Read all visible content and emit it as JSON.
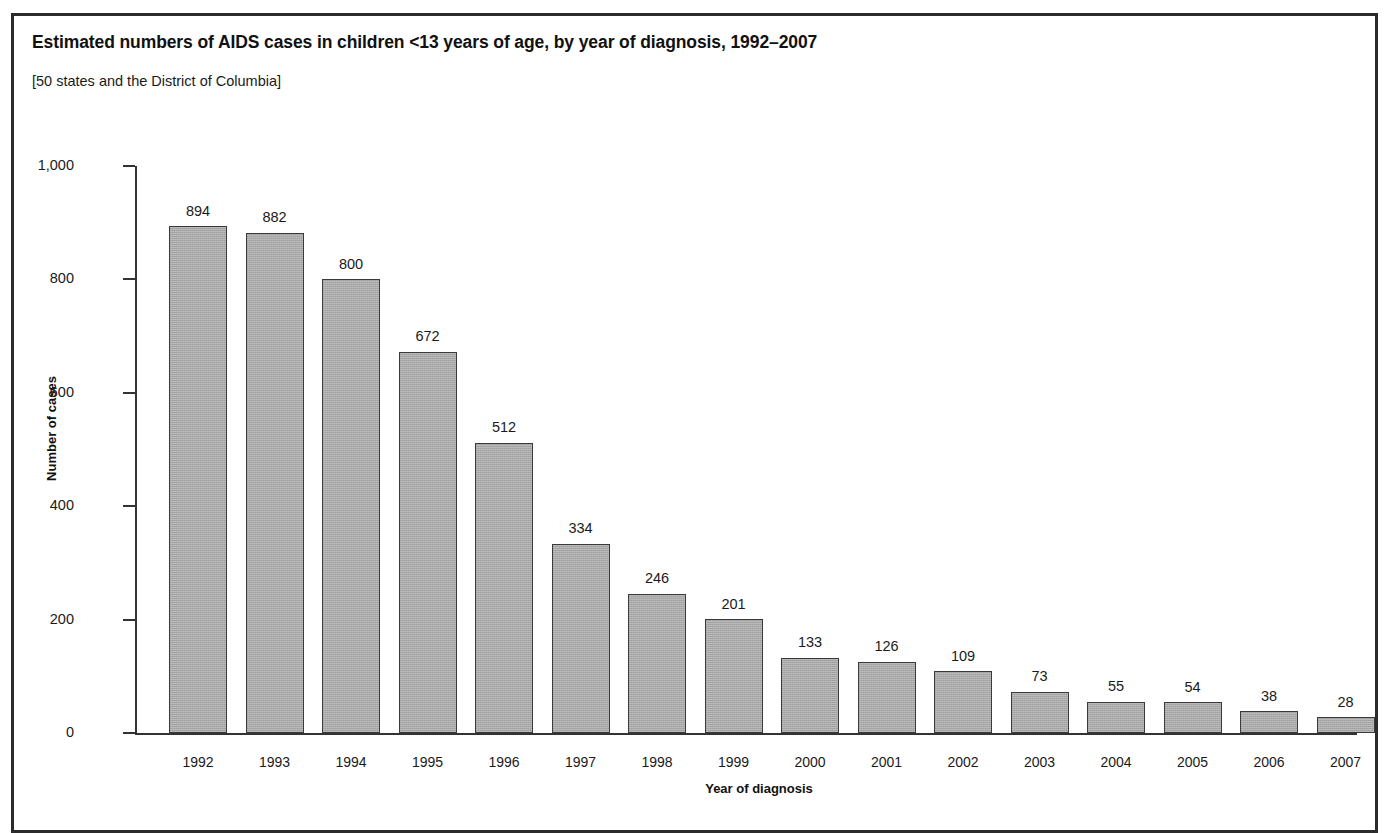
{
  "figure": {
    "title": "Estimated numbers of AIDS cases in children <13 years of age, by year of diagnosis, 1992–2007",
    "subtitle": "[50 states and the District of Columbia]",
    "border_color": "#2b2b2b",
    "background_color": "#ffffff"
  },
  "chart_data": {
    "type": "bar",
    "title": "Estimated numbers of AIDS cases in children <13 years of age, by year of diagnosis, 1992–2007",
    "subtitle": "[50 states and the District of Columbia]",
    "xlabel": "Year of diagnosis",
    "ylabel": "Number of cases",
    "categories": [
      "1992",
      "1993",
      "1994",
      "1995",
      "1996",
      "1997",
      "1998",
      "1999",
      "2000",
      "2001",
      "2002",
      "2003",
      "2004",
      "2005",
      "2006",
      "2007"
    ],
    "values": [
      894,
      882,
      800,
      672,
      512,
      334,
      246,
      201,
      133,
      126,
      109,
      73,
      55,
      54,
      38,
      28
    ],
    "value_labels": [
      "894",
      "882",
      "800",
      "672",
      "512",
      "334",
      "246",
      "201",
      "133",
      "126",
      "109",
      "73",
      "55",
      "54",
      "38",
      "28"
    ],
    "ylim": [
      0,
      1000
    ],
    "yticks": [
      0,
      200,
      400,
      600,
      800,
      1000
    ],
    "ytick_labels": [
      "0",
      "200",
      "400",
      "600",
      "800",
      "1,000"
    ],
    "grid": false,
    "legend": false,
    "bar_fill_color": "#a9a9a9",
    "bar_edge_color": "#3a3a3a",
    "axis_color": "#333333"
  }
}
